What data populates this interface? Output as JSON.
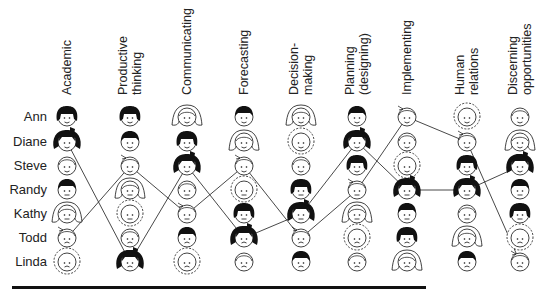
{
  "columns": [
    {
      "label": "Academic",
      "x": 67
    },
    {
      "label": "Productive\nthinking",
      "x": 130
    },
    {
      "label": "Communicating",
      "x": 187
    },
    {
      "label": "Forecasting",
      "x": 244
    },
    {
      "label": "Decision-\nmaking",
      "x": 301
    },
    {
      "label": "Planning\n(designing)",
      "x": 357
    },
    {
      "label": "Implementing",
      "x": 407
    },
    {
      "label": "Human\nrelations",
      "x": 467
    },
    {
      "label": "Discerning\nopportunities",
      "x": 520
    }
  ],
  "people": [
    "Ann",
    "Diane",
    "Steve",
    "Randy",
    "Kathy",
    "Todd",
    "Linda"
  ],
  "row_y": [
    117,
    142,
    166,
    190,
    214,
    238,
    262
  ],
  "face_types": {
    "Ann": "black-bob",
    "Diane": "black-bow",
    "Steve": "outline-plain",
    "Randy": "black-short",
    "Kathy": "outline-long",
    "Todd": "outline-cowlick",
    "Linda": "outline-curly"
  },
  "rankings": [
    [
      "Ann",
      "Diane",
      "Steve",
      "Randy",
      "Kathy",
      "Todd",
      "Linda"
    ],
    [
      "Ann",
      "Randy",
      "Todd",
      "Kathy",
      "Linda",
      "Steve",
      "Diane"
    ],
    [
      "Kathy",
      "Ann",
      "Diane",
      "Steve",
      "Todd",
      "Randy",
      "Linda"
    ],
    [
      "Randy",
      "Kathy",
      "Todd",
      "Linda",
      "Ann",
      "Diane",
      "Steve"
    ],
    [
      "Kathy",
      "Linda",
      "Steve",
      "Ann",
      "Diane",
      "Todd",
      "Randy"
    ],
    [
      "Randy",
      "Diane",
      "Ann",
      "Todd",
      "Kathy",
      "Linda",
      "Steve"
    ],
    [
      "Todd",
      "Steve",
      "Linda",
      "Diane",
      "Randy",
      "Ann",
      "Kathy"
    ],
    [
      "Linda",
      "Todd",
      "Ann",
      "Diane",
      "Steve",
      "Kathy",
      "Randy"
    ],
    [
      "Steve",
      "Kathy",
      "Diane",
      "Randy",
      "Ann",
      "Linda",
      "Todd"
    ]
  ],
  "traced_people": [
    "Diane",
    "Todd"
  ],
  "colors": {
    "ink": "#111111",
    "line": "#333333",
    "background": "#ffffff"
  }
}
